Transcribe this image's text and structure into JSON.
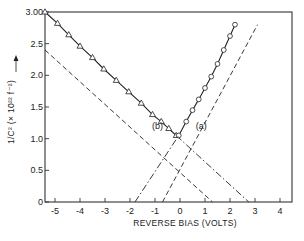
{
  "chart_data": {
    "type": "line",
    "title": "",
    "xlabel": "REVERSE BIAS (VOLTS)",
    "ylabel": "1/C² (× 10²² f⁻²)",
    "xlim": [
      -5.4,
      4.5
    ],
    "ylim": [
      0,
      3.0
    ],
    "x_ticks": [
      -5,
      -4,
      -3,
      -2,
      -1,
      0,
      1,
      2,
      3,
      4
    ],
    "x_tick_labels": [
      "-5",
      "-4",
      "-3",
      "-2",
      "-1",
      "0",
      "1",
      "2",
      "3",
      "4"
    ],
    "y_ticks": [
      0,
      0.5,
      1.0,
      1.5,
      2.0,
      2.5,
      3.0
    ],
    "y_tick_labels": [
      "0",
      "0.5",
      "1.0",
      "1.5",
      "2.0",
      "2.5",
      "3.00"
    ],
    "grid": false,
    "legend": "none (curves labeled inline)",
    "annotations": [
      {
        "text": "(b)",
        "x": -0.9,
        "y": 1.15
      },
      {
        "text": "(a)",
        "x": 0.85,
        "y": 1.15
      }
    ],
    "series": [
      {
        "name": "(b) measured",
        "style": "solid",
        "marker": "triangle",
        "x": [
          -5.4,
          -4.9,
          -4.45,
          -4.0,
          -3.5,
          -3.05,
          -2.55,
          -2.05,
          -1.55,
          -1.1,
          -0.75,
          -0.45,
          -0.15
        ],
        "y": [
          3.0,
          2.82,
          2.64,
          2.46,
          2.28,
          2.1,
          1.92,
          1.74,
          1.56,
          1.38,
          1.27,
          1.16,
          1.05
        ]
      },
      {
        "name": "(b) extrapolation",
        "style": "dash-dot",
        "x": [
          -0.15,
          2.75
        ],
        "y": [
          1.05,
          0.0
        ]
      },
      {
        "name": "(b) dashed parallel",
        "style": "dashed",
        "x": [
          -5.4,
          1.3
        ],
        "y": [
          2.4,
          0.0
        ]
      },
      {
        "name": "(a) measured",
        "style": "solid",
        "marker": "circle",
        "x": [
          -0.05,
          0.25,
          0.5,
          0.75,
          1.0,
          1.25,
          1.5,
          1.75,
          2.0,
          2.2
        ],
        "y": [
          1.05,
          1.27,
          1.45,
          1.62,
          1.8,
          1.98,
          2.18,
          2.4,
          2.62,
          2.8
        ]
      },
      {
        "name": "(a) extrapolation",
        "style": "dash-dot",
        "x": [
          -1.8,
          -0.05
        ],
        "y": [
          0.0,
          1.05
        ]
      },
      {
        "name": "(a) dashed parallel",
        "style": "dashed",
        "x": [
          -0.7,
          3.1
        ],
        "y": [
          0.0,
          2.8
        ]
      }
    ]
  }
}
